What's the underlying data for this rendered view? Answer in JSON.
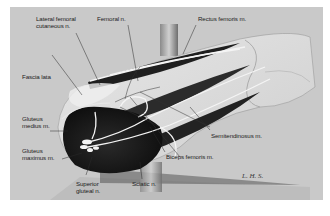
{
  "figure": {
    "type": "anatomical-illustration",
    "colors": {
      "background": "#c9c9c9",
      "page": "#ffffff",
      "dark_muscle": "#1e1e1e",
      "skin_light": "#e4e4e4",
      "nerve": "#f2f2f2",
      "leader_line": "#2a2a2a"
    },
    "labels": [
      {
        "id": "lateral-femoral-cutaneous",
        "text": "Lateral femoral\ncutaneous n."
      },
      {
        "id": "femoral",
        "text": "Femoral n."
      },
      {
        "id": "rectus-femoris",
        "text": "Rectus femoris m."
      },
      {
        "id": "fascia-lata",
        "text": "Fascia lata"
      },
      {
        "id": "gluteus-medius",
        "text": "Gluteus\nmedius m."
      },
      {
        "id": "gluteus-maximus",
        "text": "Gluteus\nmaximus m."
      },
      {
        "id": "semitendinosus",
        "text": "Semitendinosus m."
      },
      {
        "id": "biceps-femoris",
        "text": "Biceps femoris m."
      },
      {
        "id": "superior-gluteal",
        "text": "Superior\ngluteal n."
      },
      {
        "id": "sciatic",
        "text": "Sciatic n."
      }
    ],
    "signature": "L. H. S."
  }
}
